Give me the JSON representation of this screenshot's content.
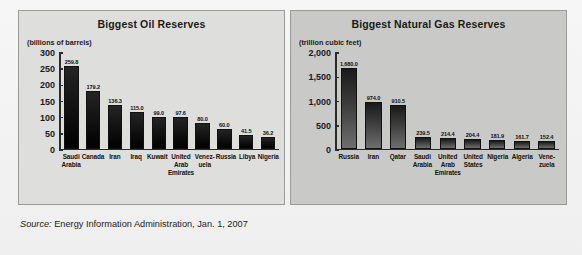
{
  "source": {
    "label": "Source:",
    "text": "Energy Information Administration, Jan. 1, 2007"
  },
  "panels": [
    {
      "id": "oil",
      "title": "Biggest Oil Reserves",
      "unit": "(billions of barrels)"
    },
    {
      "id": "gas",
      "title": "Biggest Natural Gas Reserves",
      "unit": "(trillion cubic feet)"
    }
  ],
  "chart_data": [
    {
      "type": "bar",
      "title": "Biggest Oil Reserves",
      "xlabel": "",
      "ylabel": "(billions of barrels)",
      "ylim": [
        0,
        300
      ],
      "yticks": [
        "300",
        "250",
        "200",
        "150",
        "100",
        "50",
        "0"
      ],
      "ytick_values": [
        300,
        250,
        200,
        150,
        100,
        50,
        0
      ],
      "grid": false,
      "legend": "none",
      "bar_color": "#111111",
      "categories": [
        "Saudi Arabia",
        "Canada",
        "Iran",
        "Iraq",
        "Kuwait",
        "United Arab Emirates",
        "Venez- uela",
        "Russia",
        "Libya",
        "Nigeria"
      ],
      "category_lines": [
        [
          "Saudi",
          "Arabia"
        ],
        [
          "Canada"
        ],
        [
          "Iran"
        ],
        [
          "Iraq"
        ],
        [
          "Kuwait"
        ],
        [
          "United",
          "Arab",
          "Emirates"
        ],
        [
          "Venez-",
          "uela"
        ],
        [
          "Russia"
        ],
        [
          "Libya"
        ],
        [
          "Nigeria"
        ]
      ],
      "values": [
        259.8,
        179.2,
        136.3,
        115.0,
        99.0,
        97.6,
        80.0,
        60.0,
        41.5,
        36.2
      ],
      "data_labels": [
        "259.8",
        "179.2",
        "136.3",
        "115.0",
        "99.0",
        "97.6",
        "80.0",
        "60.0",
        "41.5",
        "36.2"
      ]
    },
    {
      "type": "bar",
      "title": "Biggest Natural Gas Reserves",
      "xlabel": "",
      "ylabel": "(trillion cubic feet)",
      "ylim": [
        0,
        2000
      ],
      "yticks": [
        "2,000",
        "1,500",
        "1,000",
        "500",
        "0"
      ],
      "ytick_values": [
        2000,
        1500,
        1000,
        500,
        0
      ],
      "grid": false,
      "legend": "none",
      "bar_color": "#3d3d3d",
      "categories": [
        "Russia",
        "Iran",
        "Qatar",
        "Saudi Arabia",
        "United Arab Emirates",
        "United States",
        "Nigeria",
        "Algeria",
        "Vene- zuela"
      ],
      "category_lines": [
        [
          "Russia"
        ],
        [
          "Iran"
        ],
        [
          "Qatar"
        ],
        [
          "Saudi",
          "Arabia"
        ],
        [
          "United",
          "Arab",
          "Emirates"
        ],
        [
          "United",
          "States"
        ],
        [
          "Nigeria"
        ],
        [
          "Algeria"
        ],
        [
          "Vene-",
          "zuela"
        ]
      ],
      "values": [
        1680.0,
        974.0,
        910.5,
        239.5,
        214.4,
        204.4,
        181.9,
        161.7,
        152.4
      ],
      "data_labels": [
        "1,680.0",
        "974.0",
        "910.5",
        "239.5",
        "214.4",
        "204.4",
        "181.9",
        "161.7",
        "152.4"
      ]
    }
  ]
}
